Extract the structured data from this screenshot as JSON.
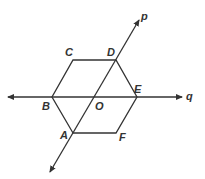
{
  "diagram": {
    "colors": {
      "stroke": "#333333",
      "background": "#ffffff"
    },
    "points": {
      "A": {
        "label": "A",
        "x": 73,
        "y": 133
      },
      "B": {
        "label": "B",
        "x": 52,
        "y": 97
      },
      "C": {
        "label": "C",
        "x": 73,
        "y": 60
      },
      "D": {
        "label": "D",
        "x": 116,
        "y": 60
      },
      "E": {
        "label": "E",
        "x": 137,
        "y": 97
      },
      "F": {
        "label": "F",
        "x": 116,
        "y": 133
      },
      "O": {
        "label": "O",
        "x": 94,
        "y": 97
      }
    },
    "lines": {
      "p": {
        "label": "p"
      },
      "q": {
        "label": "q"
      }
    }
  }
}
